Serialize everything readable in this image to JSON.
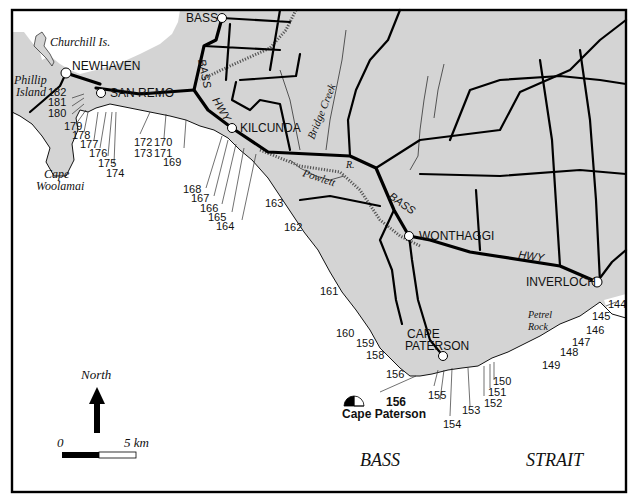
{
  "map": {
    "land_color": "#d4d4d4",
    "sea_color": "#ffffff",
    "line_color": "#000000",
    "towns": [
      {
        "label": "BASS",
        "x": 222,
        "y": 18
      },
      {
        "label": "NEWHAVEN",
        "x": 66,
        "y": 73
      },
      {
        "label": "SAN REMO",
        "x": 101,
        "y": 93
      },
      {
        "label": "KILCUNDA",
        "x": 232,
        "y": 128
      },
      {
        "label": "WONTHAGGI",
        "x": 409,
        "y": 236
      },
      {
        "label": "INVERLOCH",
        "x": 597,
        "y": 282
      },
      {
        "label": "CAPE PATERSON",
        "x": 443,
        "y": 356
      }
    ],
    "town_labels": {
      "bass": "BASS",
      "newhaven": "NEWHAVEN",
      "san_remo": "SAN REMO",
      "kilcunda": "KILCUNDA",
      "wonthaggi": "WONTHAGGI",
      "inverloch": "INVERLOCH",
      "cape_paterson_1": "CAPE",
      "cape_paterson_2": "PATERSON"
    },
    "road_labels": {
      "bass_1": "BASS",
      "hwy_1": "HWY",
      "bass_2": "BASS",
      "hwy_2": "HWY"
    },
    "features": {
      "churchill": "Churchill Is.",
      "phillip_1": "Phillip",
      "phillip_2": "Island",
      "woolamai_1": "Cape",
      "woolamai_2": "Woolamai",
      "bridge_creek": "Bridge Creek",
      "powlett": "Powlett",
      "powlett_r": "R.",
      "petrel_1": "Petrel",
      "petrel_2": "Rock"
    },
    "sea_labels": {
      "bass": "BASS",
      "strait": "STRAIT"
    },
    "site_numbers": [
      "144",
      "145",
      "146",
      "147",
      "148",
      "149",
      "150",
      "151",
      "152",
      "153",
      "154",
      "155",
      "156",
      "157",
      "158",
      "159",
      "160",
      "161",
      "162",
      "163",
      "164",
      "165",
      "166",
      "167",
      "168",
      "169",
      "170",
      "171",
      "172",
      "173",
      "174",
      "175",
      "176",
      "177",
      "178",
      "179",
      "180",
      "181",
      "182"
    ],
    "highlight_site": {
      "number": "156",
      "name": "Cape Paterson"
    },
    "north_arrow": {
      "label": "North"
    },
    "scale_bar": {
      "start": "0",
      "end": "5 km"
    }
  }
}
